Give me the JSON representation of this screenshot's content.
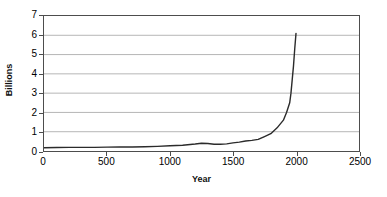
{
  "chart_data": {
    "type": "line",
    "title": "",
    "xlabel": "Year",
    "ylabel": "Billions",
    "xlim": [
      0,
      2500
    ],
    "ylim": [
      0,
      7
    ],
    "grid": "horizontal",
    "legend": "none",
    "x_ticks": [
      "0",
      "500",
      "1000",
      "1500",
      "2000",
      "2500"
    ],
    "x_tick_values": [
      0,
      500,
      1000,
      1500,
      2000,
      2500
    ],
    "y_ticks": [
      "0",
      "1",
      "2",
      "3",
      "4",
      "5",
      "6",
      "7"
    ],
    "y_tick_values": [
      0,
      1,
      2,
      3,
      4,
      5,
      6,
      7
    ],
    "series": [
      {
        "name": "World population",
        "color": "#2b2b2b",
        "x": [
          0,
          100,
          200,
          300,
          400,
          500,
          600,
          700,
          800,
          900,
          1000,
          1100,
          1200,
          1250,
          1300,
          1350,
          1400,
          1450,
          1500,
          1550,
          1600,
          1650,
          1700,
          1750,
          1800,
          1850,
          1900,
          1925,
          1950,
          1960,
          1970,
          1980,
          1990,
          2000
        ],
        "y": [
          0.17,
          0.18,
          0.19,
          0.19,
          0.19,
          0.2,
          0.21,
          0.21,
          0.22,
          0.24,
          0.27,
          0.3,
          0.36,
          0.4,
          0.39,
          0.35,
          0.35,
          0.37,
          0.42,
          0.46,
          0.52,
          0.55,
          0.6,
          0.75,
          0.9,
          1.2,
          1.6,
          2.0,
          2.5,
          3.0,
          3.7,
          4.4,
          5.3,
          6.1
        ]
      }
    ]
  },
  "axes": {
    "y_title": "Billions",
    "x_title": "Year"
  },
  "colors": {
    "line": "#2b2b2b",
    "gridline": "#b5b5b5",
    "axis": "#4d4d4d",
    "background": "#ffffff",
    "text": "#000000"
  }
}
